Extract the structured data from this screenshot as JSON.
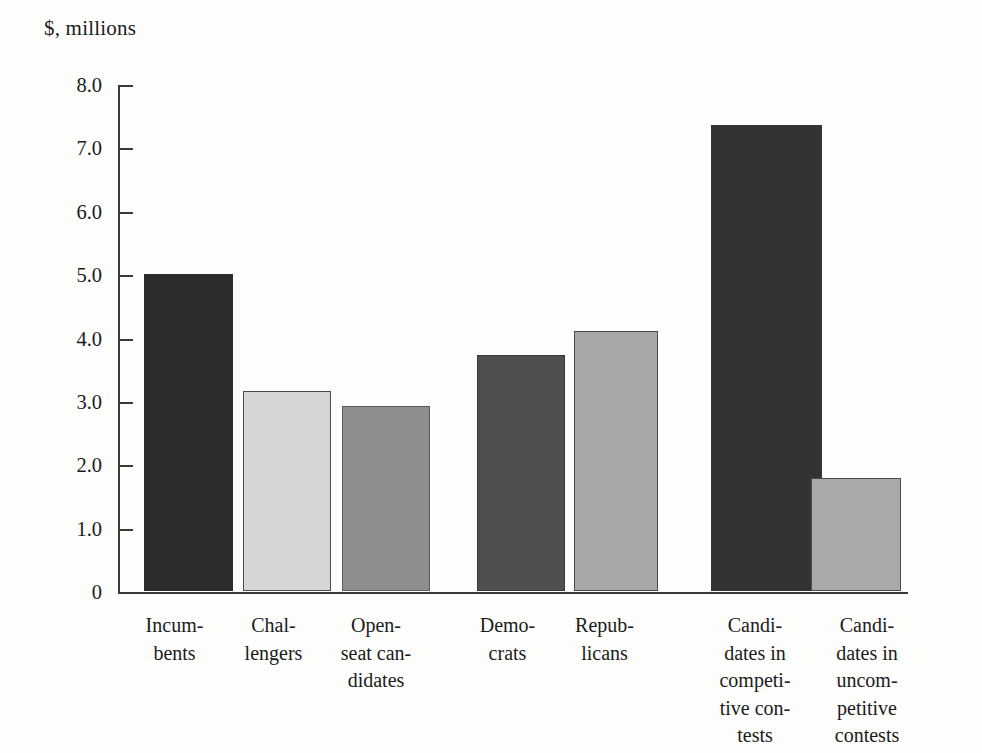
{
  "chart_data": {
    "type": "bar",
    "title": "$, millions",
    "xlabel": "",
    "ylabel": "$, millions",
    "ylim": [
      0,
      8
    ],
    "grid": false,
    "legend": "none",
    "ytick_labels": [
      "8.0",
      "7.0",
      "6.0",
      "5.0",
      "4.0",
      "3.0",
      "2.0",
      "1.0",
      "0"
    ],
    "ytick_values": [
      8,
      7,
      6,
      5,
      4,
      3,
      2,
      1,
      0
    ],
    "categories": [
      "Incumbents",
      "Challengers",
      "Open-seat candidates",
      "Democrats",
      "Republicans",
      "Candidates in competitive contests",
      "Candidates in uncompetitive contests"
    ],
    "category_labels_wrapped": [
      "Incum-\nbents",
      "Chal-\nlengers",
      "Open-\nseat can-\ndidates",
      "Demo-\ncrats",
      "Repub-\nlicans",
      "Candi-\ndates in\ncompeti-\ntive con-\ntests",
      "Candi-\ndates in\nuncom-\npetitive\ncontests"
    ],
    "values": [
      5.0,
      3.15,
      2.92,
      3.72,
      4.1,
      7.35,
      1.78
    ],
    "bar_colors": [
      "#2c2c2c",
      "#d6d6d6",
      "#8d8d8d",
      "#4f4f4f",
      "#a8a8a8",
      "#333333",
      "#a9a9a9"
    ],
    "bar_edge_colors": [
      "#2c2c2c",
      "#4a4a4a",
      "#5a5a5a",
      "#3a3a3a",
      "#4a4a4a",
      "#333333",
      "#4a4a4a"
    ],
    "groups": [
      {
        "name": "candidate-status",
        "members": [
          "Incumbents",
          "Challengers",
          "Open-seat candidates"
        ]
      },
      {
        "name": "party",
        "members": [
          "Democrats",
          "Republicans"
        ]
      },
      {
        "name": "contest-competitiveness",
        "members": [
          "Candidates in competitive contests",
          "Candidates in uncompetitive contests"
        ]
      }
    ]
  },
  "layout": {
    "bars_px": [
      {
        "left": 26,
        "width": 89,
        "top_value": 5.0
      },
      {
        "left": 125,
        "width": 88,
        "top_value": 3.15
      },
      {
        "left": 224,
        "width": 88,
        "top_value": 2.92
      },
      {
        "left": 359,
        "width": 88,
        "top_value": 3.72
      },
      {
        "left": 456,
        "width": 84,
        "top_value": 4.1
      },
      {
        "left": 593,
        "width": 111,
        "top_value": 7.35
      },
      {
        "left": 693,
        "width": 90,
        "top_value": 1.78
      }
    ],
    "label_px": [
      {
        "left": 122,
        "width": 105
      },
      {
        "left": 221,
        "width": 105
      },
      {
        "left": 316,
        "width": 120
      },
      {
        "left": 455,
        "width": 105
      },
      {
        "left": 552,
        "width": 105
      },
      {
        "left": 695,
        "width": 120
      },
      {
        "left": 812,
        "width": 110
      }
    ]
  }
}
